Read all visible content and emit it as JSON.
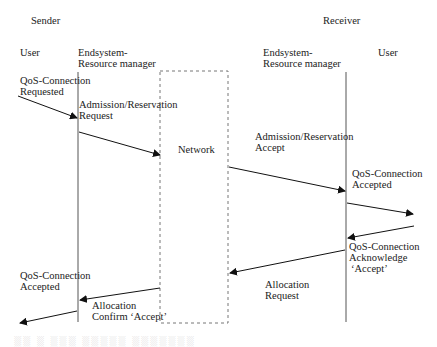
{
  "diagram": {
    "type": "sequence",
    "groups": {
      "sender": "Sender",
      "receiver": "Receiver"
    },
    "participants": {
      "sender_user": "User",
      "sender_rm_line1": "Endsystem-",
      "sender_rm_line2": "Resource manager",
      "network": "Network",
      "receiver_rm_line1": "Endsystem-",
      "receiver_rm_line2": "Resource manager",
      "receiver_user": "User"
    },
    "messages": [
      {
        "id": "m1",
        "line1": "QoS-Connection",
        "line2": "Requested",
        "from": "sender_user",
        "to": "sender_rm"
      },
      {
        "id": "m2",
        "line1": "Admission/Reservation",
        "line2": "Request",
        "from": "sender_rm",
        "to": "network"
      },
      {
        "id": "m3",
        "line1": "Admission/Reservation",
        "line2": "Accept",
        "from": "network",
        "to": "receiver_rm"
      },
      {
        "id": "m4",
        "line1": "QoS-Connection",
        "line2": "Accepted",
        "from": "receiver_rm",
        "to": "receiver_user"
      },
      {
        "id": "m5",
        "line1": "QoS-Connection",
        "line2": "Acknowledge",
        "line3": "‘Accept’",
        "from": "receiver_user",
        "to": "receiver_rm"
      },
      {
        "id": "m6",
        "line1": "Allocation",
        "line2": "Request",
        "from": "receiver_rm",
        "to": "network"
      },
      {
        "id": "m7",
        "line1": "Allocation",
        "line2": "Confirm ‘Accept’",
        "from": "network",
        "to": "sender_rm"
      },
      {
        "id": "m8",
        "line1": "QoS-Connection",
        "line2": "Accepted",
        "from": "sender_rm",
        "to": "sender_user"
      }
    ],
    "caption": "(partially visible caption text)"
  }
}
